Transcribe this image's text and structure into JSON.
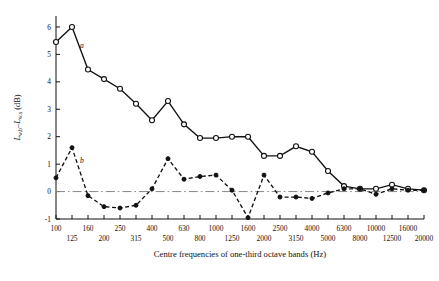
{
  "chart_data": {
    "type": "line",
    "title": "",
    "xlabel": "Centre frequencies of one-third octave bands (Hz)",
    "ylabel": "L_{w,b} - L_{w,s} (dB)",
    "ylabel_parts": {
      "main1": "L",
      "sub1": "w,b",
      "dash": "–",
      "main2": "L",
      "sub2": "w,s",
      "units": " (dB)"
    },
    "ylim": [
      -1,
      6.4
    ],
    "yticks": [
      -1,
      0,
      1,
      2,
      3,
      4,
      5,
      6
    ],
    "ytick_labels": [
      "-1",
      "0",
      "1",
      "2",
      "3",
      "4",
      "5",
      "6"
    ],
    "grid": false,
    "zero_line": true,
    "zero_line_style": "dash-dot",
    "legend_position": "inline-annotation",
    "x_categories": [
      "100",
      "125",
      "160",
      "200",
      "250",
      "315",
      "400",
      "500",
      "630",
      "800",
      "1000",
      "1250",
      "1600",
      "2000",
      "2500",
      "3150",
      "4000",
      "5000",
      "6300",
      "8000",
      "10000",
      "12500",
      "16000",
      "20000"
    ],
    "x_labels_upper": [
      "100",
      "",
      "160",
      "",
      "250",
      "",
      "400",
      "",
      "630",
      "",
      "1000",
      "",
      "1600",
      "",
      "2500",
      "",
      "4000",
      "",
      "6300",
      "",
      "10000",
      "",
      "16000",
      ""
    ],
    "x_labels_lower": [
      "",
      "125",
      "",
      "200",
      "",
      "315",
      "",
      "500",
      "",
      "800",
      "",
      "1250",
      "",
      "2000",
      "",
      "3150",
      "",
      "5000",
      "",
      "8000",
      "",
      "12500",
      "",
      "20000"
    ],
    "series": [
      {
        "name": "a",
        "label": "a",
        "marker": "open-circle",
        "linestyle": "solid",
        "color": "#111111",
        "values": [
          5.45,
          6.0,
          4.45,
          4.1,
          3.75,
          3.2,
          2.6,
          3.3,
          2.45,
          1.95,
          1.95,
          2.0,
          2.0,
          1.3,
          1.3,
          1.65,
          1.45,
          0.75,
          0.2,
          0.1,
          0.1,
          0.25,
          0.1,
          0.05
        ]
      },
      {
        "name": "b",
        "label": "b",
        "marker": "filled-circle",
        "linestyle": "dashed",
        "color": "#111111",
        "values": [
          0.5,
          1.6,
          -0.15,
          -0.55,
          -0.6,
          -0.5,
          0.1,
          1.2,
          0.45,
          0.55,
          0.6,
          0.05,
          -0.95,
          0.6,
          -0.2,
          -0.2,
          -0.25,
          -0.05,
          0.1,
          0.1,
          -0.1,
          0.1,
          0.05,
          0.05
        ]
      }
    ]
  }
}
